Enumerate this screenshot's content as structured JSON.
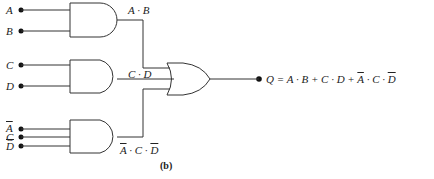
{
  "diagram": {
    "type": "logic-circuit",
    "inputs": [
      {
        "name": "A",
        "negated": false
      },
      {
        "name": "B",
        "negated": false
      },
      {
        "name": "C",
        "negated": false
      },
      {
        "name": "D",
        "negated": false
      },
      {
        "name": "A",
        "negated": true
      },
      {
        "name": "C",
        "negated": false
      },
      {
        "name": "D",
        "negated": true
      }
    ],
    "gates": [
      {
        "id": "and1",
        "type": "AND",
        "inputs": [
          "A",
          "B"
        ],
        "output_label": "A · B"
      },
      {
        "id": "and2",
        "type": "AND",
        "inputs": [
          "C",
          "D"
        ],
        "output_label": "C · D"
      },
      {
        "id": "and3",
        "type": "AND",
        "inputs": [
          "¬A",
          "C",
          "¬D"
        ],
        "output_label_parts": [
          "A",
          " · C · ",
          "D"
        ]
      },
      {
        "id": "or1",
        "type": "OR",
        "inputs": [
          "and1",
          "and2",
          "and3"
        ]
      }
    ],
    "output": {
      "prefix": "Q = A · B + C · D + ",
      "a_bar": "A",
      "mid": " · C · ",
      "d_bar": "D"
    },
    "subfigure_label": "(b)"
  },
  "labels": {
    "in_a": "A",
    "in_b": "B",
    "in_c": "C",
    "in_d": "D",
    "in_abar": "A",
    "in_c2": "C",
    "in_dbar": "D",
    "out1": "A · B",
    "out2": "C · D",
    "out3_a": "A",
    "out3_mid": " · C · ",
    "out3_d": "D"
  }
}
